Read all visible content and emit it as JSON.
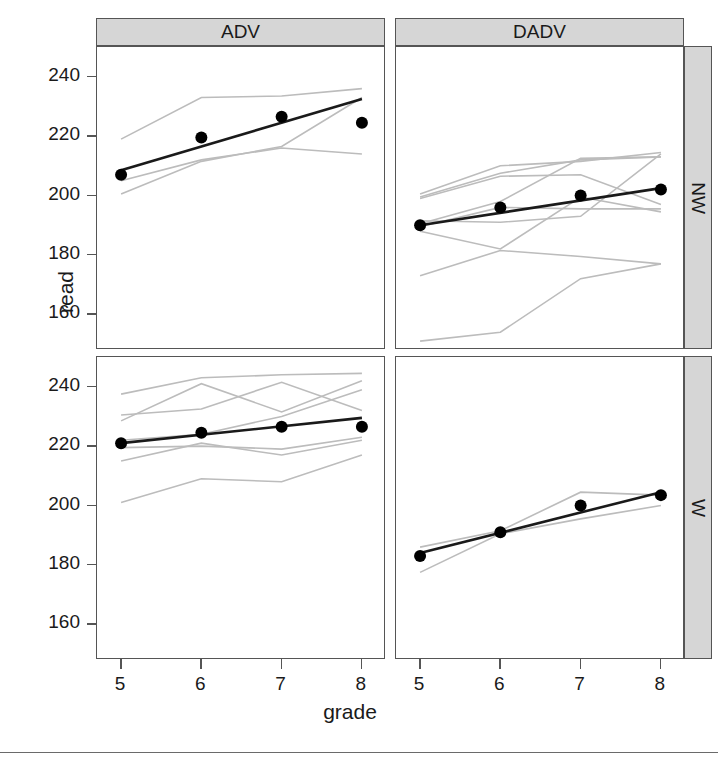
{
  "axes": {
    "ylabel": "read",
    "xlabel": "grade",
    "yticks": [
      160,
      180,
      200,
      220,
      240
    ],
    "xticks": [
      5,
      6,
      7,
      8
    ],
    "ylim": [
      148,
      250
    ],
    "xlim": [
      4.7,
      8.3
    ]
  },
  "strips": {
    "columns": [
      "ADV",
      "DADV"
    ],
    "rows": [
      "NW",
      "W"
    ]
  },
  "colors": {
    "point": "#000000",
    "fit_line": "#1a1a1a",
    "subject_line": "#bcbcbc",
    "strip_fill": "#d6d6d6",
    "strip_border": "#555555",
    "panel_border": "#555555"
  },
  "chart_data": {
    "type": "line",
    "title": "",
    "xlabel": "grade",
    "ylabel": "read",
    "xlim": [
      4.7,
      8.3
    ],
    "ylim": [
      148,
      250
    ],
    "grid": false,
    "legend": null,
    "panel_variables": {
      "columns": [
        "ADV",
        "DADV"
      ],
      "rows": [
        "NW",
        "W"
      ]
    },
    "panels": [
      {
        "column": "ADV",
        "row": "NW",
        "x": [
          5,
          6,
          7,
          8
        ],
        "means": [
          207,
          219.5,
          226.5,
          224.5
        ],
        "fit_line": {
          "x": [
            5,
            8
          ],
          "y": [
            208.5,
            232.5
          ]
        },
        "subjects": [
          {
            "x": [
              5,
              6,
              7,
              8
            ],
            "y": [
              219,
              233,
              233.5,
              236
            ]
          },
          {
            "x": [
              5,
              6,
              7,
              8
            ],
            "y": [
              205,
              212,
              216,
              214
            ]
          },
          {
            "x": [
              5,
              6,
              7,
              8
            ],
            "y": [
              200.5,
              211.5,
              216.5,
              233
            ]
          }
        ]
      },
      {
        "column": "DADV",
        "row": "NW",
        "x": [
          5,
          6,
          7,
          8
        ],
        "means": [
          190,
          196,
          200,
          202
        ],
        "fit_line": {
          "x": [
            5,
            8
          ],
          "y": [
            190,
            202.5
          ]
        },
        "subjects": [
          {
            "x": [
              5,
              6,
              7,
              8
            ],
            "y": [
              200.5,
              210,
              211.5,
              214.5
            ]
          },
          {
            "x": [
              5,
              6,
              7,
              8
            ],
            "y": [
              199.5,
              207.5,
              212,
              213
            ]
          },
          {
            "x": [
              5,
              6,
              7,
              8
            ],
            "y": [
              199,
              206.5,
              207,
              197
            ]
          },
          {
            "x": [
              5,
              6,
              7,
              8
            ],
            "y": [
              191.5,
              191,
              193,
              214
            ]
          },
          {
            "x": [
              5,
              6,
              7,
              8
            ],
            "y": [
              190.5,
              198,
              212.5,
              213
            ]
          },
          {
            "x": [
              5,
              6,
              7,
              8
            ],
            "y": [
              189.5,
              196,
              195.5,
              195.5
            ]
          },
          {
            "x": [
              5,
              6,
              7,
              8
            ],
            "y": [
              188,
              182,
              199.5,
              194.5
            ]
          },
          {
            "x": [
              5,
              6,
              7,
              8
            ],
            "y": [
              173,
              181.5,
              179.5,
              177
            ]
          },
          {
            "x": [
              5,
              6,
              7,
              8
            ],
            "y": [
              151,
              154,
              172,
              177
            ]
          }
        ]
      },
      {
        "column": "ADV",
        "row": "W",
        "x": [
          5,
          6,
          7,
          8
        ],
        "means": [
          221,
          224.5,
          226.5,
          226.5
        ],
        "fit_line": {
          "x": [
            5,
            8
          ],
          "y": [
            221,
            229.5
          ]
        },
        "subjects": [
          {
            "x": [
              5,
              6,
              7,
              8
            ],
            "y": [
              237.5,
              243,
              244,
              244.5
            ]
          },
          {
            "x": [
              5,
              6,
              7,
              8
            ],
            "y": [
              228.5,
              241,
              231.5,
              242
            ]
          },
          {
            "x": [
              5,
              6,
              7,
              8
            ],
            "y": [
              230.5,
              232.5,
              241.5,
              232
            ]
          },
          {
            "x": [
              5,
              6,
              7,
              8
            ],
            "y": [
              222,
              224,
              230,
              239
            ]
          },
          {
            "x": [
              5,
              6,
              7,
              8
            ],
            "y": [
              219.5,
              220,
              219,
              223
            ]
          },
          {
            "x": [
              5,
              6,
              7,
              8
            ],
            "y": [
              215,
              221,
              217,
              222
            ]
          },
          {
            "x": [
              5,
              6,
              7,
              8
            ],
            "y": [
              201,
              209,
              208,
              217
            ]
          }
        ]
      },
      {
        "column": "DADV",
        "row": "W",
        "x": [
          5,
          6,
          7,
          8
        ],
        "means": [
          183,
          191,
          200,
          203.5
        ],
        "fit_line": {
          "x": [
            5,
            8
          ],
          "y": [
            184,
            204.5
          ]
        },
        "subjects": [
          {
            "x": [
              5,
              6,
              7,
              8
            ],
            "y": [
              186,
              191.5,
              204.5,
              203.5
            ]
          },
          {
            "x": [
              5,
              6,
              7,
              8
            ],
            "y": [
              177.5,
              190.5,
              195.5,
              200
            ]
          }
        ]
      }
    ]
  }
}
